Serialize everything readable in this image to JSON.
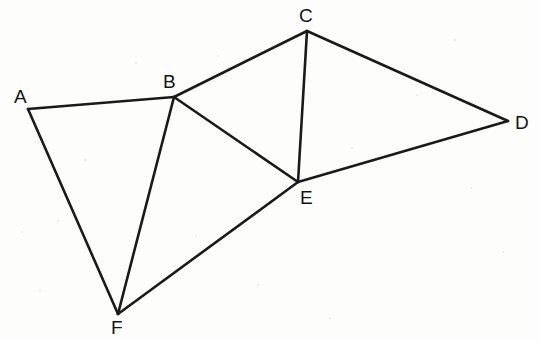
{
  "figure": {
    "width": 539,
    "height": 341,
    "background_color": "#fdfdfc",
    "line_color": "#1a1a1a",
    "line_width": 2.6,
    "label_color": "#141414",
    "vertices": [
      {
        "id": "A",
        "label": "A",
        "x": 28,
        "y": 109,
        "label_x": 14,
        "label_y": 87
      },
      {
        "id": "B",
        "label": "B",
        "x": 174,
        "y": 97,
        "label_x": 163,
        "label_y": 72
      },
      {
        "id": "C",
        "label": "C",
        "x": 307,
        "y": 31,
        "label_x": 299,
        "label_y": 6
      },
      {
        "id": "D",
        "label": "D",
        "x": 508,
        "y": 121,
        "label_x": 515,
        "label_y": 113
      },
      {
        "id": "E",
        "label": "E",
        "x": 298,
        "y": 182,
        "label_x": 300,
        "label_y": 188
      },
      {
        "id": "F",
        "label": "F",
        "x": 118,
        "y": 314,
        "label_x": 111,
        "label_y": 318
      }
    ],
    "edges": [
      {
        "id": "AB",
        "from": "A",
        "to": "B"
      },
      {
        "id": "AF",
        "from": "A",
        "to": "F"
      },
      {
        "id": "BF",
        "from": "B",
        "to": "F"
      },
      {
        "id": "BC",
        "from": "B",
        "to": "C"
      },
      {
        "id": "BE",
        "from": "B",
        "to": "E"
      },
      {
        "id": "CE",
        "from": "C",
        "to": "E"
      },
      {
        "id": "CD",
        "from": "C",
        "to": "D"
      },
      {
        "id": "DE",
        "from": "D",
        "to": "E"
      },
      {
        "id": "EF",
        "from": "E",
        "to": "F"
      }
    ],
    "specks": [
      {
        "x": 22,
        "y": 232,
        "r": 1.4
      },
      {
        "x": 58,
        "y": 221,
        "r": 1.1
      },
      {
        "x": 40,
        "y": 291,
        "r": 1.0
      },
      {
        "x": 136,
        "y": 63,
        "r": 1.2
      },
      {
        "x": 218,
        "y": 56,
        "r": 1.1
      },
      {
        "x": 196,
        "y": 236,
        "r": 1.3
      },
      {
        "x": 258,
        "y": 285,
        "r": 1.0
      },
      {
        "x": 352,
        "y": 148,
        "r": 1.2
      },
      {
        "x": 417,
        "y": 95,
        "r": 1.1
      },
      {
        "x": 471,
        "y": 188,
        "r": 1.3
      },
      {
        "x": 503,
        "y": 252,
        "r": 1.0
      },
      {
        "x": 330,
        "y": 318,
        "r": 1.1
      },
      {
        "x": 85,
        "y": 160,
        "r": 1.0
      },
      {
        "x": 455,
        "y": 40,
        "r": 1.1
      }
    ]
  }
}
